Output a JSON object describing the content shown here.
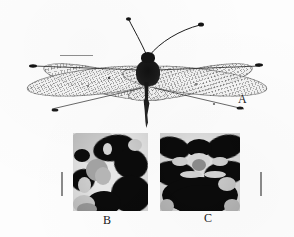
{
  "figure": {
    "type": "scientific-figure-plate",
    "background_color": "#ffffff",
    "ink_color": "#1b1b1b",
    "panel_count": 3
  },
  "panels": [
    {
      "id": "A",
      "label": "A",
      "content": "whole mounted adult insect, dorsal view, wings spread",
      "has_scale_bar": true,
      "scale_bar_orientation": "horizontal"
    },
    {
      "id": "B",
      "label": "B",
      "content": "close-up photograph of dark mottled wing-base pattern, left specimen",
      "has_scale_bar": true,
      "scale_bar_orientation": "vertical"
    },
    {
      "id": "C",
      "label": "C",
      "content": "close-up photograph of dark mottled wing-base pattern, right specimen",
      "has_scale_bar": true,
      "scale_bar_orientation": "vertical"
    }
  ],
  "specimen": {
    "antennae": "long, slender, with dark clubbed apex",
    "wings": "two pairs, elongate, hyaline with fine reticulate venation",
    "pterostigma": "dark elongate spot near each wing apex",
    "body": "dark head and thorax, slender elongate abdomen"
  },
  "labels": {
    "a": "A",
    "b": "B",
    "c": "C"
  },
  "colors": {
    "paper": "#fdfdfd",
    "ink": "#1b1b1b",
    "wing_membrane": "#ededed",
    "vein": "#3c3c3c",
    "dark_blob": "#0b0b0b",
    "scale_bar": "#5a5a5a"
  }
}
